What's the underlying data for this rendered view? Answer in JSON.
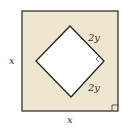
{
  "figure": {
    "outer_square": {
      "fill": "#efe6cf",
      "stroke": "#333333",
      "side_label_left": "x",
      "side_label_bottom": "x"
    },
    "inner_square": {
      "fill": "#ffffff",
      "stroke": "#222222",
      "side_label_upper": "2y",
      "side_label_lower": "2y"
    },
    "right_angle_marker_color": "#5a6fb0"
  }
}
